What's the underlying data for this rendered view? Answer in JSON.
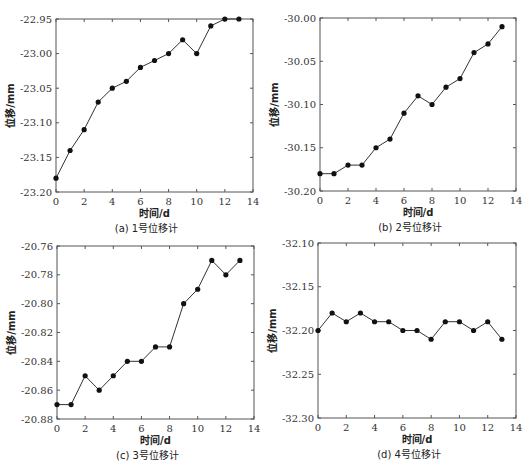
{
  "chart_data": [
    {
      "id": "a",
      "type": "line",
      "caption": "(a) 1号位移计",
      "xlabel": "时间/d",
      "ylabel": "位移/mm",
      "xlim": [
        0,
        14
      ],
      "ylim": [
        -23.2,
        -22.95
      ],
      "xticks": [
        0,
        2,
        4,
        6,
        8,
        10,
        12,
        14
      ],
      "yticks": [
        -23.2,
        -23.15,
        -23.1,
        -23.05,
        -23.0,
        -22.95
      ],
      "ytick_labels": [
        "-23.20",
        "-23.15",
        "-23.10",
        "-23.05",
        "-23.00",
        "-22.95"
      ],
      "grid": false,
      "marker": "filled-circle",
      "x": [
        0,
        1,
        2,
        3,
        4,
        5,
        6,
        7,
        8,
        9,
        10,
        11,
        12,
        13
      ],
      "values": [
        -23.18,
        -23.14,
        -23.11,
        -23.07,
        -23.05,
        -23.04,
        -23.02,
        -23.01,
        -23.0,
        -22.98,
        -23.0,
        -22.96,
        -22.95,
        -22.95
      ],
      "frame": {
        "left": 56,
        "top": 19,
        "right": 253,
        "bottom": 192
      }
    },
    {
      "id": "b",
      "type": "line",
      "caption": "(b) 2号位移计",
      "xlabel": "时间/d",
      "ylabel": "位移/mm",
      "xlim": [
        0,
        14
      ],
      "ylim": [
        -30.2,
        -30.0
      ],
      "xticks": [
        0,
        2,
        4,
        6,
        8,
        10,
        12,
        14
      ],
      "yticks": [
        -30.2,
        -30.15,
        -30.1,
        -30.05,
        -30.0
      ],
      "ytick_labels": [
        "-30.20",
        "-30.15",
        "-30.10",
        "-30.05",
        "-30.00"
      ],
      "grid": false,
      "marker": "filled-circle",
      "x": [
        0,
        1,
        2,
        3,
        4,
        5,
        6,
        7,
        8,
        9,
        10,
        11,
        12,
        13
      ],
      "values": [
        -30.18,
        -30.18,
        -30.17,
        -30.17,
        -30.15,
        -30.14,
        -30.11,
        -30.09,
        -30.1,
        -30.08,
        -30.07,
        -30.04,
        -30.03,
        -30.01
      ],
      "frame": {
        "left": 320,
        "top": 18,
        "right": 516,
        "bottom": 191
      }
    },
    {
      "id": "c",
      "type": "line",
      "caption": "(c) 3号位移计",
      "xlabel": "时间/d",
      "ylabel": "位移/mm",
      "xlim": [
        0,
        14
      ],
      "ylim": [
        -20.88,
        -20.76
      ],
      "xticks": [
        0,
        2,
        4,
        6,
        8,
        10,
        12,
        14
      ],
      "yticks": [
        -20.88,
        -20.86,
        -20.84,
        -20.82,
        -20.8,
        -20.78,
        -20.76
      ],
      "ytick_labels": [
        "-20.88",
        "-20.86",
        "-20.84",
        "-20.82",
        "-20.80",
        "-20.78",
        "-20.76"
      ],
      "grid": false,
      "marker": "filled-circle",
      "x": [
        0,
        1,
        2,
        3,
        4,
        5,
        6,
        7,
        8,
        9,
        10,
        11,
        12,
        13
      ],
      "values": [
        -20.87,
        -20.87,
        -20.85,
        -20.86,
        -20.85,
        -20.84,
        -20.84,
        -20.83,
        -20.83,
        -20.8,
        -20.79,
        -20.77,
        -20.78,
        -20.77
      ],
      "frame": {
        "left": 57,
        "top": 246,
        "right": 254,
        "bottom": 419
      }
    },
    {
      "id": "d",
      "type": "line",
      "caption": "(d) 4号位移计",
      "xlabel": "时间/d",
      "ylabel": "位移/mm",
      "xlim": [
        0,
        14
      ],
      "ylim": [
        -32.3,
        -32.1
      ],
      "xticks": [
        0,
        2,
        4,
        6,
        8,
        10,
        12,
        14
      ],
      "yticks": [
        -32.3,
        -32.25,
        -32.2,
        -32.15,
        -32.1
      ],
      "ytick_labels": [
        "-32.30",
        "-32.25",
        "-32.20",
        "-32.15",
        "-32.10"
      ],
      "grid": false,
      "marker": "filled-circle",
      "x": [
        0,
        1,
        2,
        3,
        4,
        5,
        6,
        7,
        8,
        9,
        10,
        11,
        12,
        13
      ],
      "values": [
        -32.2,
        -32.18,
        -32.19,
        -32.18,
        -32.19,
        -32.19,
        -32.2,
        -32.2,
        -32.21,
        -32.19,
        -32.19,
        -32.2,
        -32.19,
        -32.21
      ],
      "frame": {
        "left": 318,
        "top": 243,
        "right": 516,
        "bottom": 418
      }
    }
  ],
  "style": {
    "line_color": "#333333",
    "marker_color": "#111111",
    "frame_color": "#555555",
    "background": "#ffffff"
  }
}
